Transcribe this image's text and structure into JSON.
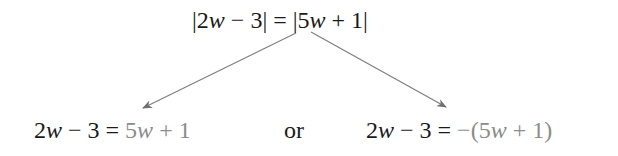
{
  "top_equation": {
    "abs_left_open": "|",
    "left_coef": "2",
    "left_var": "w",
    "left_op": "−",
    "left_const": "3",
    "abs_left_close": "|",
    "equals": "=",
    "abs_right_open": "|",
    "right_coef": "5",
    "right_var": "w",
    "right_op": "+",
    "right_const": "1",
    "abs_right_close": "|"
  },
  "left_case": {
    "lhs_coef": "2",
    "lhs_var": "w",
    "lhs_op": "−",
    "lhs_const": "3",
    "equals": "=",
    "rhs_coef": "5",
    "rhs_var": "w",
    "rhs_op": "+",
    "rhs_const": "1"
  },
  "connector": "or",
  "right_case": {
    "lhs_coef": "2",
    "lhs_var": "w",
    "lhs_op": "−",
    "lhs_const": "3",
    "equals": "=",
    "rhs_prefix": "−(",
    "rhs_coef": "5",
    "rhs_var": "w",
    "rhs_op": "+",
    "rhs_const": "1",
    "rhs_suffix": ")"
  },
  "colors": {
    "text": "#1a1a1a",
    "highlight": "#8c8c8c",
    "arrow": "#808080"
  }
}
